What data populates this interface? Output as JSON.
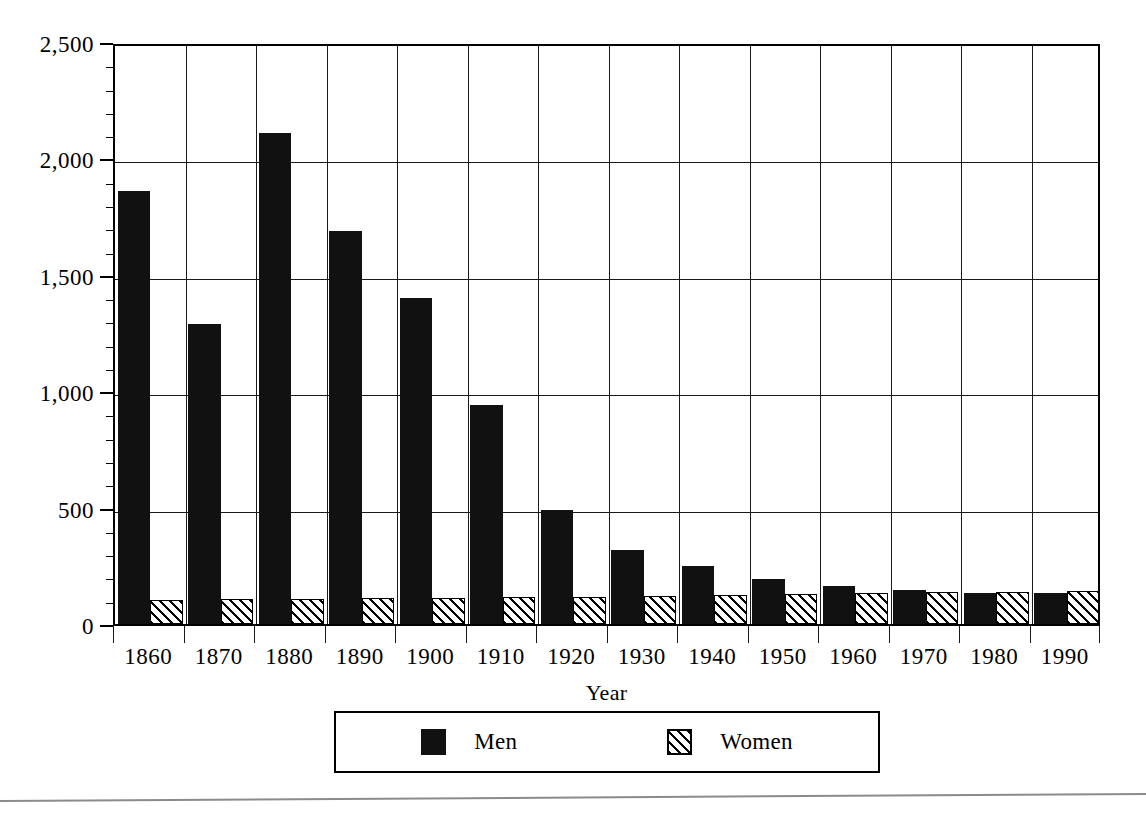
{
  "chart_data": {
    "type": "bar",
    "title": "",
    "xlabel": "Year",
    "ylabel": "",
    "categories": [
      "1860",
      "1870",
      "1880",
      "1890",
      "1900",
      "1910",
      "1920",
      "1930",
      "1940",
      "1950",
      "1960",
      "1970",
      "1980",
      "1990"
    ],
    "series": [
      {
        "name": "Men",
        "fill": "solid-black",
        "values": [
          1860,
          1290,
          2110,
          1690,
          1400,
          940,
          490,
          318,
          249,
          195,
          163,
          148,
          135,
          132
        ]
      },
      {
        "name": "Women",
        "fill": "diagonal-hatch",
        "values": [
          105,
          108,
          108,
          110,
          112,
          115,
          118,
          122,
          126,
          130,
          133,
          136,
          138,
          140
        ]
      }
    ],
    "ylim": [
      0,
      2500
    ],
    "ytick_values": [
      0,
      500,
      1000,
      1500,
      2000,
      2500
    ],
    "ytick_labels": [
      "0",
      "500",
      "1,000",
      "1,500",
      "2,000",
      "2,500"
    ],
    "yminor_interval": 100,
    "grid": "both",
    "legend_position": "below-axis",
    "bar_grouping": "grouped"
  },
  "axes": {
    "y_labels": [
      "2,500",
      "2,000",
      "1,500",
      "1,000",
      "500",
      "0"
    ],
    "x_labels": [
      "1860",
      "1870",
      "1880",
      "1890",
      "1900",
      "1910",
      "1920",
      "1930",
      "1940",
      "1950",
      "1960",
      "1970",
      "1980",
      "1990"
    ],
    "x_title": "Year"
  },
  "legend": {
    "entries": [
      {
        "label": "Men",
        "swatch": "solid-black-square"
      },
      {
        "label": "Women",
        "swatch": "hatched-square"
      }
    ]
  },
  "footer": {
    "clipped_caption": ""
  }
}
